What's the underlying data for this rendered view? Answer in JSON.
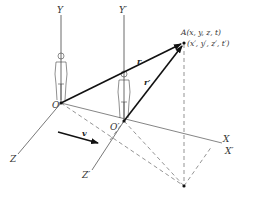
{
  "diagram": {
    "frame_S": {
      "origin_label": "O",
      "axes": {
        "x": "X",
        "y": "Y",
        "z": "Z"
      }
    },
    "frame_S_prime": {
      "origin_label": "O′",
      "axes": {
        "x": "X′",
        "y": "Y′",
        "z": "Z′"
      }
    },
    "event": {
      "label": "A(x, y, z, t)",
      "primed_coords": "(x′, y′, z′, t′)"
    },
    "vectors": {
      "r": "r",
      "r_prime": "r′",
      "velocity": "v"
    },
    "colors": {
      "line": "#222222",
      "axis": "#555555",
      "dashed": "#666666"
    }
  }
}
